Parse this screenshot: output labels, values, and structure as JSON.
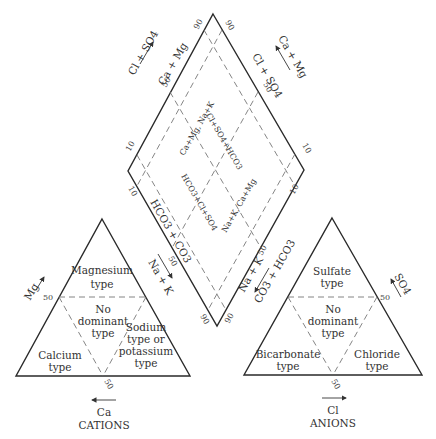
{
  "diagram": {
    "type": "piper",
    "diamond": {
      "upper_left_axis": "Ca + Mg",
      "upper_right_axis": "Cl + SO4",
      "lower_left_axis": "HCO3 + CO3",
      "lower_right_axis": "Na + K",
      "outer_left_arrow": "Cl + SO4",
      "outer_right_arrow": "Ca + Mg",
      "outer_lower_left_arrow": "Na + K",
      "outer_lower_right_arrow": "CO3 + HCO3",
      "inner_labels": {
        "top_left": "Ca+Mg, Na+K",
        "top_right": "Cl+SO4+HCO3",
        "bottom_left": "HCO3+Cl+SO4",
        "bottom_right": "Na+K, Ca+Mg"
      },
      "ticks": {
        "top_left": "90",
        "top_right": "90",
        "upper_left_mid": "50",
        "upper_right_mid": "50",
        "left_upper": "10",
        "left_lower": "10",
        "right_upper": "10",
        "right_lower": "10",
        "lower_left_mid": "50",
        "lower_right_mid": "50",
        "bottom_left": "90",
        "bottom_right": "90"
      }
    },
    "cations": {
      "title": "CATIONS",
      "bottom_axis": "Ca",
      "left_axis": "Mg",
      "right_axis": "Na + K",
      "tick_left": "50",
      "tick_bottom": "50",
      "regions": {
        "top": [
          "Magnesium",
          "type"
        ],
        "center": [
          "No",
          "dominant",
          "type"
        ],
        "left": [
          "Calcium",
          "type"
        ],
        "right": [
          "Sodium",
          "type  or",
          "potassium",
          "type"
        ]
      }
    },
    "anions": {
      "title": "ANIONS",
      "bottom_axis": "Cl",
      "right_axis": "SO4",
      "tick_right": "50",
      "tick_bottom": "50",
      "regions": {
        "top": [
          "Sulfate",
          "type"
        ],
        "center": [
          "No",
          "dominant",
          "type"
        ],
        "left": [
          "Bicarbonate",
          "type"
        ],
        "right": [
          "Chloride",
          "type"
        ]
      }
    },
    "colors": {
      "line": "#2a2a2a",
      "dash": "#777777",
      "text": "#333333",
      "background": "#ffffff"
    }
  }
}
